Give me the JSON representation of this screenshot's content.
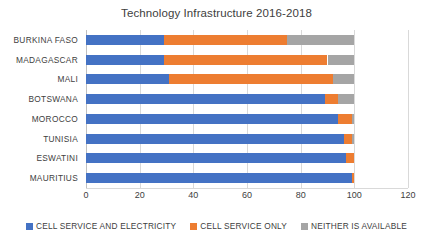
{
  "chart_data": {
    "type": "bar",
    "orientation": "horizontal",
    "stacked": true,
    "title": "Technology Infrastructure 2016-2018",
    "xlabel": "",
    "ylabel": "",
    "xlim": [
      0,
      120
    ],
    "xticks": [
      0,
      20,
      40,
      60,
      80,
      100,
      120
    ],
    "grid": true,
    "legend_position": "bottom",
    "categories": [
      "BURKINA FASO",
      "MADAGASCAR",
      "MALI",
      "BOTSWANA",
      "MOROCCO",
      "TUNISIA",
      "ESWATINI",
      "MAURITIUS"
    ],
    "series": [
      {
        "name": "CELL SERVICE AND ELECTRICITY",
        "color": "#4472C4",
        "values": [
          29,
          29,
          31,
          89,
          94,
          96,
          97,
          99
        ]
      },
      {
        "name": "CELL SERVICE ONLY",
        "color": "#ED7D31",
        "values": [
          46,
          61,
          61,
          5,
          5,
          3,
          3,
          1
        ]
      },
      {
        "name": "NEITHER IS AVAILABLE",
        "color": "#A5A5A5",
        "values": [
          25,
          10,
          8,
          6,
          1,
          1,
          0,
          0
        ]
      }
    ]
  },
  "axis": {
    "tick_labels": [
      "0",
      "20",
      "40",
      "60",
      "80",
      "100",
      "120"
    ]
  },
  "colors": {
    "series_1": "#4472C4",
    "series_2": "#ED7D31",
    "series_3": "#A5A5A5",
    "gridline": "#d9d9d9",
    "text": "#404040",
    "background": "#ffffff"
  }
}
